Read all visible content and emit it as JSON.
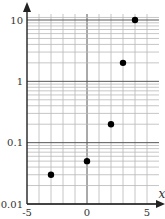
{
  "chart_data": {
    "type": "scatter",
    "title": "",
    "xlabel": "x",
    "ylabel": "",
    "x_scale": "linear",
    "y_scale": "log",
    "xlim": [
      -5,
      5.5
    ],
    "ylim": [
      0.01,
      12
    ],
    "x_ticks": [
      {
        "value": -5,
        "label": "-5"
      },
      {
        "value": 0,
        "label": "0"
      },
      {
        "value": 5,
        "label": "5"
      }
    ],
    "y_ticks": [
      {
        "value": 0.01,
        "label": "0.01"
      },
      {
        "value": 0.1,
        "label": "0.1"
      },
      {
        "value": 1,
        "label": "1"
      },
      {
        "value": 10,
        "label": "10"
      }
    ],
    "grid": true,
    "legend": null,
    "series": [
      {
        "name": "points",
        "color": "#000000",
        "points": [
          {
            "x": -3,
            "y": 0.03
          },
          {
            "x": 0,
            "y": 0.05
          },
          {
            "x": 2,
            "y": 0.2
          },
          {
            "x": 3,
            "y": 2
          },
          {
            "x": 4,
            "y": 10
          }
        ]
      }
    ]
  },
  "colors": {
    "axis": "#222222",
    "major_grid": "#555555",
    "minor_grid": "#b8b8b8",
    "point": "#000000",
    "label": "#333333"
  }
}
